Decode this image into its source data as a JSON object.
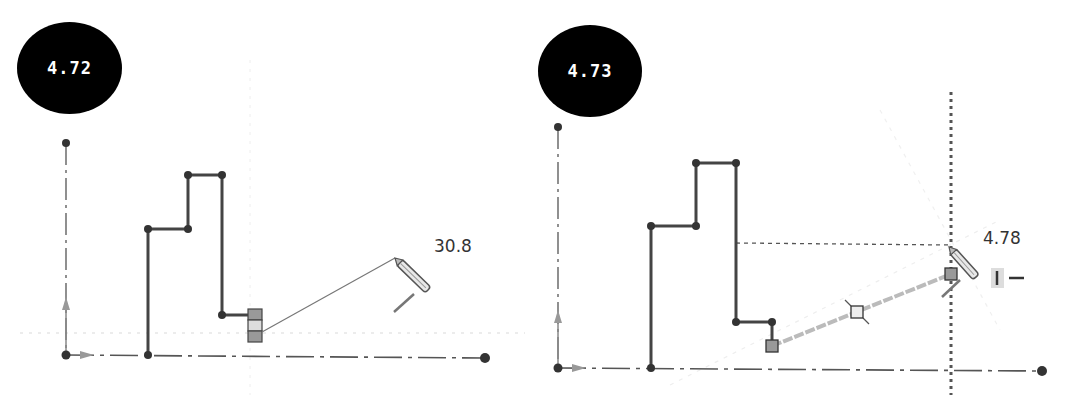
{
  "panels": [
    {
      "id": "left",
      "step_label": "4.72",
      "dimension_value": "30.8",
      "dimension_pos": [
        434,
        236
      ],
      "colors": {
        "profile": "#444444",
        "axis": "#555555",
        "guide": "#cccccc",
        "handle": "#888888"
      },
      "origin": [
        66,
        355
      ],
      "vertical_axis": {
        "top": [
          66,
          143
        ],
        "bottom": [
          66,
          355
        ]
      },
      "horizontal_axis": {
        "left": [
          66,
          355
        ],
        "right": [
          485,
          358
        ]
      },
      "profile_points": [
        [
          148,
          355
        ],
        [
          148,
          229
        ],
        [
          188,
          229
        ],
        [
          188,
          175
        ],
        [
          222,
          175
        ],
        [
          222,
          315
        ],
        [
          248,
          315
        ]
      ],
      "constraint_glyph": {
        "x": 248,
        "y": 309,
        "w": 14,
        "h": 33
      },
      "rubber_band": {
        "from": [
          262,
          332
        ],
        "to": [
          395,
          258
        ]
      },
      "pencil": {
        "tip": [
          395,
          258
        ],
        "end": [
          428,
          290
        ]
      },
      "tick_mark": {
        "from": [
          394,
          312
        ],
        "to": [
          414,
          294
        ]
      },
      "inference_line_y": 333
    },
    {
      "id": "right",
      "step_label": "4.73",
      "dimension_value": "4.78",
      "dimension_pos": [
        453,
        228
      ],
      "colors": {
        "profile": "#444444",
        "axis": "#555555",
        "guide": "#aaaaaa",
        "handle": "#888888"
      },
      "origin": [
        28,
        368
      ],
      "vertical_axis": {
        "top": [
          28,
          127
        ],
        "bottom": [
          28,
          368
        ]
      },
      "horizontal_axis": {
        "left": [
          28,
          368
        ],
        "right": [
          512,
          371
        ]
      },
      "profile_points": [
        [
          121,
          368
        ],
        [
          121,
          226
        ],
        [
          166,
          226
        ],
        [
          166,
          163
        ],
        [
          206,
          163
        ],
        [
          206,
          322
        ],
        [
          242,
          322
        ],
        [
          242,
          345
        ]
      ],
      "end_square": [
        242,
        346
      ],
      "mid_square": [
        327,
        312
      ],
      "active_square": [
        421,
        274
      ],
      "vertical_guide_x": 421,
      "horizontal_guide": {
        "from": [
          206,
          243
        ],
        "to": [
          421,
          245
        ]
      },
      "pencil": {
        "tip": [
          419,
          247
        ],
        "end": [
          446,
          277
        ]
      },
      "tick_mark": {
        "from": [
          412,
          297
        ],
        "to": [
          430,
          280
        ]
      },
      "constraint_hint_icons": [
        "vertical-constraint-icon",
        "horizontal-constraint-icon"
      ],
      "constraint_hint_pos": [
        465,
        278
      ]
    }
  ]
}
